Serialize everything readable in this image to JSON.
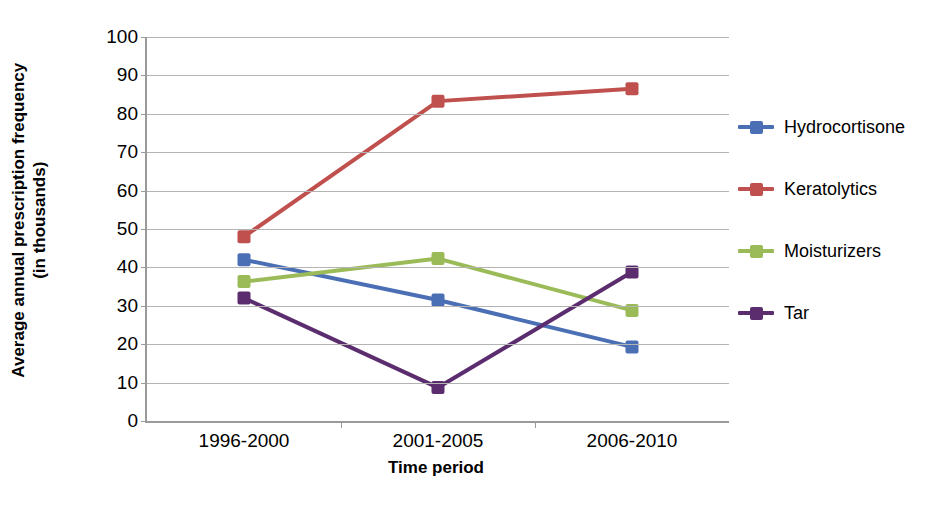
{
  "chart_data": {
    "type": "line",
    "title": "",
    "xlabel": "Time period",
    "ylabel": "Average annual prescription frequency (in thousands)",
    "ylabel_lines": [
      "Average annual prescription frequency",
      "(in thousands)"
    ],
    "categories": [
      "1996-2000",
      "2001-2005",
      "2006-2010"
    ],
    "ylim": [
      0,
      100
    ],
    "yticks": [
      0,
      10,
      20,
      30,
      40,
      50,
      60,
      70,
      80,
      90,
      100
    ],
    "grid": true,
    "legend_position": "right",
    "series": [
      {
        "name": "Hydrocortisone",
        "color": "#4A6FB5",
        "values": [
          42.0,
          31.5,
          19.3
        ]
      },
      {
        "name": "Keratolytics",
        "color": "#C0504D",
        "values": [
          48.0,
          83.3,
          86.5
        ]
      },
      {
        "name": "Moisturizers",
        "color": "#9BBB59",
        "values": [
          36.3,
          42.3,
          28.8
        ]
      },
      {
        "name": "Tar",
        "color": "#5B2D6E",
        "values": [
          32.0,
          8.7,
          38.8
        ]
      }
    ]
  },
  "axis": {
    "grid_color": "#b3b3b3",
    "axis_color": "#9a9a9a"
  }
}
